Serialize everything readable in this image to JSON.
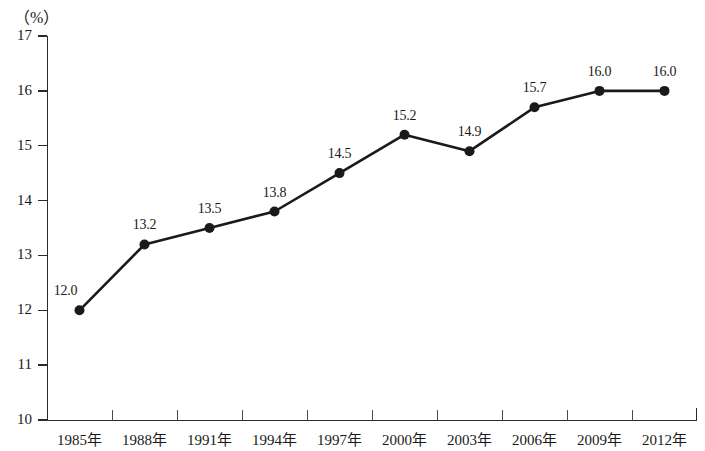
{
  "chart_data": {
    "type": "line",
    "title": "",
    "subtitle": "",
    "xlabel": "",
    "ylabel": "",
    "unit_label": "（%）",
    "categories": [
      "1985年",
      "1988年",
      "1991年",
      "1994年",
      "1997年",
      "2000年",
      "2003年",
      "2006年",
      "2009年",
      "2012年"
    ],
    "values": [
      12.0,
      13.2,
      13.5,
      13.8,
      14.5,
      15.2,
      14.9,
      15.7,
      16.0,
      16.0
    ],
    "point_labels": [
      "12.0",
      "13.2",
      "13.5",
      "13.8",
      "14.5",
      "15.2",
      "14.9",
      "15.7",
      "16.0",
      "16.0"
    ],
    "ylim": [
      10,
      17
    ],
    "ytick_values": [
      17,
      16,
      15,
      14,
      13,
      12,
      11,
      10
    ],
    "ytick_labels": [
      "17",
      "16",
      "15",
      "14",
      "13",
      "12",
      "11",
      "10"
    ],
    "grid": false,
    "legend": "none",
    "series": [
      {
        "name": "",
        "values": [
          12.0,
          13.2,
          13.5,
          13.8,
          14.5,
          15.2,
          14.9,
          15.7,
          16.0,
          16.0
        ],
        "line_color": "#1a1a1a",
        "marker": "filled-circle",
        "marker_color": "#1a1a1a"
      }
    ]
  },
  "colors": {
    "background": "#ffffff",
    "axis": "#2b2b2b",
    "line": "#1a1a1a",
    "text": "#1a1a1a"
  }
}
